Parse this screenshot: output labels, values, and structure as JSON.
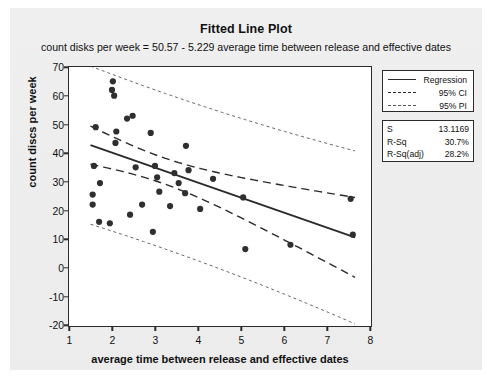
{
  "chart_data": {
    "type": "scatter",
    "title": "Fitted Line Plot",
    "subtitle": "count disks per week = 50.57 - 5.229 average time between release and effective dates",
    "xlabel": "average time between release and effective dates",
    "ylabel": "count discs per week",
    "xlim": [
      1,
      8
    ],
    "ylim": [
      -20,
      70
    ],
    "xticks": [
      1,
      2,
      3,
      4,
      5,
      6,
      7,
      8
    ],
    "yticks": [
      -20,
      -10,
      0,
      10,
      20,
      30,
      40,
      50,
      60,
      70
    ],
    "grid": false,
    "legend_position": "right",
    "regression": {
      "intercept": 50.57,
      "slope": -5.229
    },
    "points": [
      {
        "x": 1.55,
        "y": 22.0
      },
      {
        "x": 1.55,
        "y": 25.5
      },
      {
        "x": 1.58,
        "y": 35.5
      },
      {
        "x": 1.62,
        "y": 49.0
      },
      {
        "x": 1.7,
        "y": 16.0
      },
      {
        "x": 1.72,
        "y": 29.5
      },
      {
        "x": 1.95,
        "y": 15.5
      },
      {
        "x": 2.0,
        "y": 62.0
      },
      {
        "x": 2.02,
        "y": 65.0
      },
      {
        "x": 2.05,
        "y": 60.0
      },
      {
        "x": 2.08,
        "y": 43.5
      },
      {
        "x": 2.1,
        "y": 47.5
      },
      {
        "x": 2.35,
        "y": 52.0
      },
      {
        "x": 2.42,
        "y": 18.5
      },
      {
        "x": 2.48,
        "y": 53.0
      },
      {
        "x": 2.55,
        "y": 35.0
      },
      {
        "x": 2.7,
        "y": 22.0
      },
      {
        "x": 2.9,
        "y": 47.0
      },
      {
        "x": 2.95,
        "y": 12.5
      },
      {
        "x": 3.0,
        "y": 35.5
      },
      {
        "x": 3.05,
        "y": 31.5
      },
      {
        "x": 3.1,
        "y": 26.5
      },
      {
        "x": 3.35,
        "y": 21.5
      },
      {
        "x": 3.45,
        "y": 33.0
      },
      {
        "x": 3.55,
        "y": 29.5
      },
      {
        "x": 3.7,
        "y": 26.0
      },
      {
        "x": 3.72,
        "y": 42.5
      },
      {
        "x": 3.78,
        "y": 34.0
      },
      {
        "x": 4.05,
        "y": 20.5
      },
      {
        "x": 4.35,
        "y": 31.0
      },
      {
        "x": 5.05,
        "y": 24.5
      },
      {
        "x": 5.1,
        "y": 6.5
      },
      {
        "x": 6.15,
        "y": 8.0
      },
      {
        "x": 7.55,
        "y": 24.0
      },
      {
        "x": 7.6,
        "y": 11.5
      }
    ],
    "legend": [
      {
        "key": "solid",
        "label": "Regression"
      },
      {
        "key": "dashed",
        "label": "95% CI"
      },
      {
        "key": "dotted",
        "label": "95% PI"
      }
    ],
    "stats": [
      {
        "name": "S",
        "value": "13.1169"
      },
      {
        "name": "R-Sq",
        "value": "30.7%"
      },
      {
        "name": "R-Sq(adj)",
        "value": "28.2%"
      }
    ],
    "colors": {
      "line": "#2b2b2b",
      "point": "#2f2f2f",
      "panel": "#ececec",
      "plot_bg": "#ffffff"
    }
  }
}
